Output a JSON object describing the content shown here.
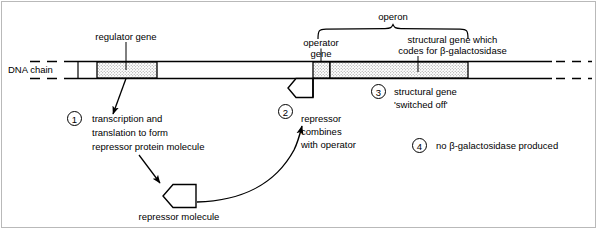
{
  "figure": {
    "dna_label": "DNA chain",
    "colors": {
      "line": "#000000",
      "gene_fill": "#d9d9d9",
      "background": "#ffffff",
      "frame": "#b9b9b9"
    }
  },
  "chain": {
    "regulator_gene_label": "regulator gene",
    "operator_gene_label_line1": "operator",
    "operator_gene_label_line2": "gene",
    "operon_label": "operon",
    "structural_gene_label_line1": "structural gene which",
    "structural_gene_label_line2": "codes for β-galactosidase"
  },
  "steps": [
    {
      "number": "1",
      "text_line1": "transcription and",
      "text_line2": "translation to form",
      "text_line3": "repressor protein molecule"
    },
    {
      "number": "2",
      "text_line1": "repressor",
      "text_line2": "combines",
      "text_line3": "with operator"
    },
    {
      "number": "3",
      "text_line1": "structural gene",
      "text_line2": "'switched off'"
    },
    {
      "number": "4",
      "text_line1": "no β-galactosidase produced"
    }
  ],
  "molecule": {
    "repressor_label": "repressor molecule"
  }
}
